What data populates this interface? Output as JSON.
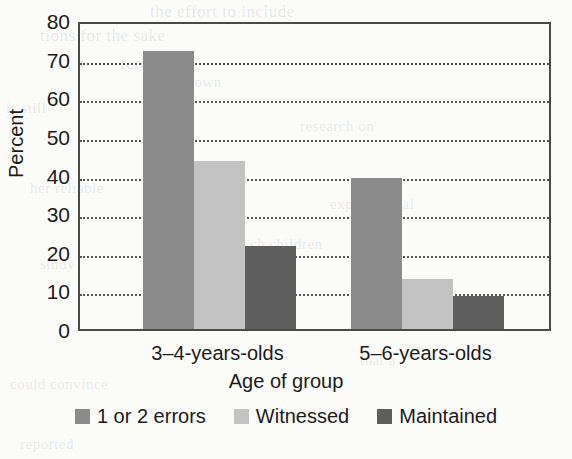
{
  "chart_data": {
    "type": "bar",
    "title": "",
    "xlabel": "Age of group",
    "ylabel": "Percent",
    "categories": [
      "3–4-years-olds",
      "5–6-years-olds"
    ],
    "series": [
      {
        "name": "1 or 2 errors",
        "color": "#8b8b8b",
        "values": [
          72,
          39
        ]
      },
      {
        "name": "Witnessed",
        "color": "#c3c3c3",
        "values": [
          43.5,
          13
        ]
      },
      {
        "name": "Maintained",
        "color": "#5e5e5e",
        "values": [
          21.5,
          8.5
        ]
      }
    ],
    "ylim": [
      0,
      80
    ],
    "yticks": [
      0,
      10,
      20,
      30,
      40,
      50,
      60,
      70,
      80
    ],
    "ytick_labels": [
      "0",
      "10",
      "20",
      "30",
      "40",
      "50",
      "60",
      "70",
      "80"
    ],
    "grid": true,
    "grid_style": "dotted",
    "legend_position": "bottom"
  },
  "axes": {
    "y_title": "Percent",
    "x_title": "Age of group"
  },
  "legend": {
    "entries": [
      {
        "label": "1 or 2 errors",
        "color": "#8b8b8b"
      },
      {
        "label": "Witnessed",
        "color": "#c3c3c3"
      },
      {
        "label": "Maintained",
        "color": "#5e5e5e"
      }
    ]
  },
  "background_text": [
    {
      "text": "the effort to include",
      "x": 150,
      "y": 2,
      "size": 17
    },
    {
      "text": "tions for the sake",
      "x": 40,
      "y": 26,
      "size": 17
    },
    {
      "text": "ference",
      "x": 120,
      "y": 54,
      "size": 17
    },
    {
      "text": "nt's own",
      "x": 168,
      "y": 74,
      "size": 15
    },
    {
      "text": "is still",
      "x": 6,
      "y": 100,
      "size": 15
    },
    {
      "text": "research on",
      "x": 300,
      "y": 118,
      "size": 15
    },
    {
      "text": "her reliable",
      "x": 30,
      "y": 180,
      "size": 15
    },
    {
      "text": "experimental",
      "x": 330,
      "y": 196,
      "size": 15
    },
    {
      "text": "ch children",
      "x": 250,
      "y": 236,
      "size": 15
    },
    {
      "text": "study",
      "x": 40,
      "y": 256,
      "size": 15
    },
    {
      "text": "could convince",
      "x": 10,
      "y": 376,
      "size": 15
    },
    {
      "text": "that a",
      "x": 360,
      "y": 352,
      "size": 15
    },
    {
      "text": "reported",
      "x": 20,
      "y": 436,
      "size": 15
    }
  ]
}
